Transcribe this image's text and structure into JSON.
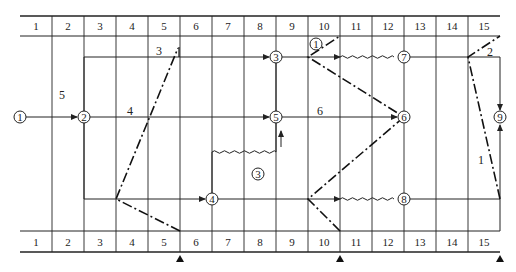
{
  "diagram": {
    "type": "time-scaled network diagram with forward/backward check lines",
    "columns": [
      "1",
      "2",
      "3",
      "4",
      "5",
      "6",
      "7",
      "8",
      "9",
      "10",
      "11",
      "12",
      "13",
      "14",
      "15"
    ],
    "nodes": [
      {
        "id": "1",
        "label": "1"
      },
      {
        "id": "2",
        "label": "2"
      },
      {
        "id": "3",
        "label": "3"
      },
      {
        "id": "4",
        "label": "4"
      },
      {
        "id": "5",
        "label": "5"
      },
      {
        "id": "6",
        "label": "6"
      },
      {
        "id": "7",
        "label": "7"
      },
      {
        "id": "8",
        "label": "8"
      },
      {
        "id": "9",
        "label": "9"
      }
    ],
    "activity_labels": [
      {
        "text": "5"
      },
      {
        "text": "3"
      },
      {
        "text": "4"
      },
      {
        "text": "6"
      },
      {
        "text": "2"
      },
      {
        "text": "1"
      }
    ],
    "check_markers": [
      {
        "label": "1",
        "circled": true
      },
      {
        "label": "3",
        "circled": true
      }
    ],
    "triangle_markers": [
      "after column 5",
      "after column 10",
      "after column 15"
    ],
    "colors": {
      "line": "#222222",
      "background": "#ffffff"
    }
  }
}
